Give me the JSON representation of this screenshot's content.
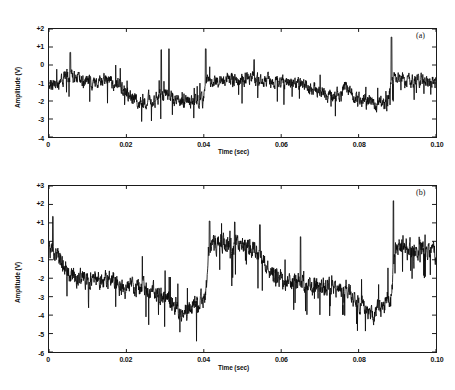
{
  "figure": {
    "type": "multi-panel-time-series",
    "background_color": "#ffffff",
    "trace_color": "#0a0a0a",
    "axis_color": "#1a1a1a"
  },
  "panels": [
    {
      "tag": "(a)",
      "xlabel": "Time (sec)",
      "ylabel": "Amplitude (V)",
      "xticks": [
        "0",
        "0.02",
        "0.04",
        "0.06",
        "0.08",
        "0.10"
      ],
      "xtick_values": [
        0,
        0.02,
        0.04,
        0.06,
        0.08,
        0.1
      ],
      "yticks": [
        "+2",
        "+1",
        "0",
        "-1",
        "-2",
        "-3",
        "-4"
      ],
      "ytick_values": [
        2,
        1,
        0,
        -1,
        -2,
        -3,
        -4
      ],
      "xlim": [
        0,
        0.1
      ],
      "ylim": [
        -4,
        2
      ]
    },
    {
      "tag": "(b)",
      "xlabel": "Time (sec)",
      "ylabel": "Amplitude (V)",
      "xticks": [
        "0",
        "0.02",
        "0.04",
        "0.06",
        "0.08",
        "0.10"
      ],
      "xtick_values": [
        0,
        0.02,
        0.04,
        0.06,
        0.08,
        0.1
      ],
      "yticks": [
        "+3",
        "+2",
        "+1",
        "0",
        "-1",
        "-2",
        "-3",
        "-4",
        "-5",
        "-6"
      ],
      "ytick_values": [
        3,
        2,
        1,
        0,
        -1,
        -2,
        -3,
        -4,
        -5,
        -6
      ],
      "xlim": [
        0,
        0.1
      ],
      "ylim": [
        -6,
        3
      ]
    }
  ],
  "chart_data": [
    {
      "type": "line",
      "title": "(a)",
      "xlabel": "Time (sec)",
      "ylabel": "Amplitude (V)",
      "xlim": [
        0,
        0.1
      ],
      "ylim": [
        -4,
        2
      ],
      "xticks": [
        0,
        0.02,
        0.04,
        0.06,
        0.08,
        0.1
      ],
      "yticks": [
        2,
        1,
        0,
        -1,
        -2,
        -3,
        -4
      ],
      "grid": false,
      "legend": "none",
      "series": [
        {
          "name": "noisy amplitude (a)",
          "description": "Dense high-frequency noise riding on a slowly varying baseline with abrupt level steps; typical noise band about 0.8 V peak-to-peak.",
          "noise_amplitude": 0.55,
          "baseline_x": [
            0.0,
            0.004,
            0.006,
            0.01,
            0.014,
            0.018,
            0.021,
            0.023,
            0.028,
            0.03,
            0.033,
            0.037,
            0.04,
            0.0405,
            0.044,
            0.048,
            0.052,
            0.056,
            0.06,
            0.064,
            0.068,
            0.072,
            0.0755,
            0.0765,
            0.08,
            0.084,
            0.0875,
            0.0885,
            0.092,
            0.096,
            0.1
          ],
          "baseline_y": [
            -1.3,
            -0.75,
            -0.6,
            -1.0,
            -0.8,
            -1.1,
            -1.7,
            -2.0,
            -1.85,
            -1.55,
            -2.0,
            -2.0,
            -2.0,
            -0.85,
            -0.9,
            -0.8,
            -0.75,
            -0.85,
            -0.9,
            -0.95,
            -1.35,
            -1.7,
            -1.75,
            -1.1,
            -1.95,
            -2.15,
            -2.2,
            -0.75,
            -0.85,
            -0.8,
            -0.95
          ],
          "peaks": [
            {
              "x": 0.0055,
              "y": 0.7
            },
            {
              "x": 0.029,
              "y": 0.85
            },
            {
              "x": 0.031,
              "y": 0.9
            },
            {
              "x": 0.0405,
              "y": 0.9
            },
            {
              "x": 0.053,
              "y": 0.3
            },
            {
              "x": 0.0885,
              "y": 1.55
            }
          ],
          "min_observed": -3.3,
          "max_observed": 1.55
        }
      ]
    },
    {
      "type": "line",
      "title": "(b)",
      "xlabel": "Time (sec)",
      "ylabel": "Amplitude (V)",
      "xlim": [
        0,
        0.1
      ],
      "ylim": [
        -6,
        3
      ],
      "xticks": [
        0,
        0.02,
        0.04,
        0.06,
        0.08,
        0.1
      ],
      "yticks": [
        3,
        2,
        1,
        0,
        -1,
        -2,
        -3,
        -4,
        -5,
        -6
      ],
      "grid": false,
      "legend": "none",
      "series": [
        {
          "name": "noisy amplitude (b)",
          "description": "Sawtooth-like slow drift downward from about 0 V to -4 V followed by an abrupt jump back up, repeated roughly every 0.045 s, buried in dense noise.",
          "noise_amplitude": 0.75,
          "baseline_x": [
            0.0,
            0.004,
            0.008,
            0.012,
            0.016,
            0.02,
            0.024,
            0.028,
            0.032,
            0.035,
            0.038,
            0.0405,
            0.0415,
            0.045,
            0.049,
            0.053,
            0.057,
            0.061,
            0.065,
            0.069,
            0.073,
            0.077,
            0.081,
            0.084,
            0.0865,
            0.0885,
            0.0895,
            0.092,
            0.096,
            0.1
          ],
          "baseline_y": [
            -0.3,
            -1.55,
            -2.1,
            -2.2,
            -2.1,
            -2.55,
            -2.6,
            -2.75,
            -3.35,
            -3.9,
            -3.4,
            -2.9,
            -0.1,
            -0.1,
            -0.25,
            -0.35,
            -1.55,
            -2.2,
            -2.25,
            -2.45,
            -2.65,
            -2.75,
            -3.6,
            -3.9,
            -3.55,
            -2.9,
            -0.3,
            -0.45,
            -0.55,
            -0.55
          ],
          "peaks": [
            {
              "x": 0.001,
              "y": 1.35
            },
            {
              "x": 0.0415,
              "y": 1.1
            },
            {
              "x": 0.048,
              "y": 1.05
            },
            {
              "x": 0.0545,
              "y": 0.9
            },
            {
              "x": 0.065,
              "y": 0.25
            },
            {
              "x": 0.089,
              "y": 2.2
            }
          ],
          "min_observed": -5.9,
          "max_observed": 2.2
        }
      ]
    }
  ]
}
